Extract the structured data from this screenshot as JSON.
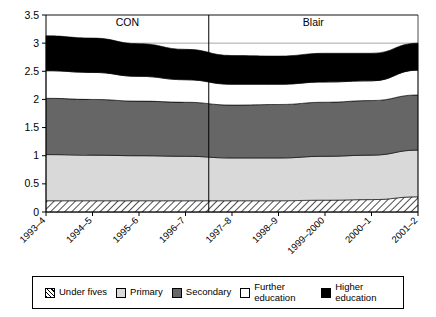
{
  "chart_data": {
    "type": "area",
    "title": "",
    "subtitle": "",
    "xlabel": "",
    "ylabel": "",
    "stacked": true,
    "grid": true,
    "legend_position": "bottom",
    "ylim": [
      0,
      3.5
    ],
    "yticks": [
      "0",
      "0.5",
      "1",
      "1.5",
      "2",
      "2.5",
      "3",
      "3.5"
    ],
    "ytick_values": [
      0,
      0.5,
      1,
      1.5,
      2,
      2.5,
      3,
      3.5
    ],
    "categories": [
      "1993–4",
      "1994–5",
      "1995–6",
      "1996–7",
      "1997–8",
      "1998–9",
      "1999–2000",
      "2000–1",
      "2001–2"
    ],
    "series": [
      {
        "name": "Under fives",
        "values": [
          0.2,
          0.2,
          0.2,
          0.2,
          0.2,
          0.2,
          0.21,
          0.22,
          0.27
        ]
      },
      {
        "name": "Primary",
        "values": [
          0.82,
          0.81,
          0.8,
          0.79,
          0.76,
          0.76,
          0.78,
          0.79,
          0.83
        ]
      },
      {
        "name": "Secondary",
        "values": [
          1.0,
          0.99,
          0.97,
          0.96,
          0.94,
          0.95,
          0.96,
          0.97,
          0.98
        ]
      },
      {
        "name": "Further education",
        "values": [
          0.49,
          0.48,
          0.44,
          0.4,
          0.37,
          0.36,
          0.36,
          0.35,
          0.44
        ]
      },
      {
        "name": "Higher education",
        "values": [
          0.62,
          0.61,
          0.58,
          0.54,
          0.51,
          0.5,
          0.51,
          0.49,
          0.48
        ]
      }
    ],
    "cumulative_tops": {
      "under_fives": [
        0.2,
        0.2,
        0.2,
        0.2,
        0.2,
        0.2,
        0.21,
        0.22,
        0.27
      ],
      "primary": [
        1.02,
        1.01,
        1.0,
        0.99,
        0.96,
        0.96,
        0.99,
        1.01,
        1.1
      ],
      "secondary": [
        2.02,
        2.0,
        1.97,
        1.95,
        1.9,
        1.91,
        1.95,
        1.98,
        2.08
      ],
      "further_education": [
        2.51,
        2.48,
        2.41,
        2.35,
        2.27,
        2.27,
        2.31,
        2.33,
        2.52
      ],
      "higher_education": [
        3.13,
        3.09,
        2.99,
        2.89,
        2.78,
        2.77,
        2.82,
        2.82,
        3.0
      ]
    },
    "annotations": [
      {
        "label": "CON",
        "span": [
          "1993–4",
          "1996–7"
        ]
      },
      {
        "label": "Blair",
        "span": [
          "1997–8",
          "2001–2"
        ]
      }
    ],
    "divider": {
      "after_category": "1996–7",
      "label": "government-change-divider"
    },
    "colors": {
      "under_fives": "#ffffff",
      "primary": "#d9d9d9",
      "secondary": "#666666",
      "further_education": "#ffffff",
      "higher_education": "#000000",
      "axis": "#000000",
      "grid": "#808080"
    }
  },
  "legend": {
    "items": [
      {
        "label": "Under fives",
        "swatch": "hatched-swatch-icon"
      },
      {
        "label": "Primary",
        "swatch": "light-gray-swatch-icon"
      },
      {
        "label": "Secondary",
        "swatch": "dark-gray-swatch-icon"
      },
      {
        "label": "Further\neducation",
        "swatch": "white-swatch-icon"
      },
      {
        "label": "Higher\neducation",
        "swatch": "black-swatch-icon"
      }
    ]
  }
}
